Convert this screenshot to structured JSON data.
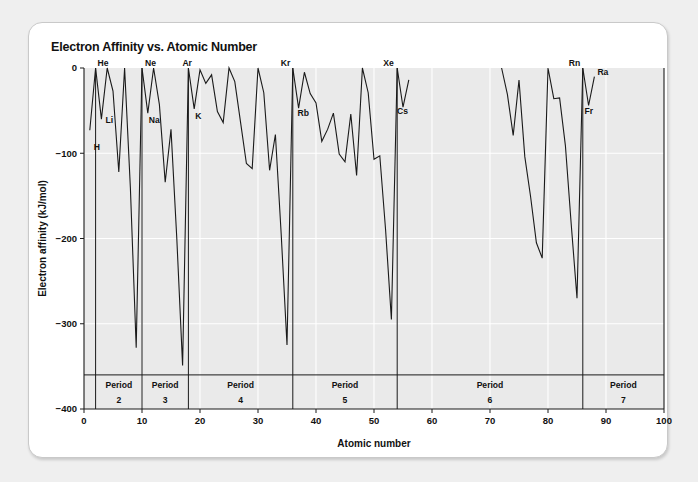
{
  "card": {
    "background": "#ffffff",
    "page_background": "#efefef"
  },
  "chart_data": {
    "type": "line",
    "title": "Electron Affinity vs. Atomic Number",
    "xlabel": "Atomic number",
    "ylabel": "Electron affinity (kJ/mol)",
    "xlim": [
      0,
      100
    ],
    "ylim": [
      -400,
      0
    ],
    "xticks": [
      0,
      10,
      20,
      30,
      40,
      50,
      60,
      70,
      80,
      90,
      100
    ],
    "yticks": [
      0,
      -100,
      -200,
      -300,
      -400
    ],
    "xtick_labels": [
      "0",
      "10",
      "20",
      "30",
      "40",
      "50",
      "60",
      "70",
      "80",
      "90",
      "100"
    ],
    "ytick_labels": [
      "0",
      "-100",
      "-200",
      "-300",
      "-400"
    ],
    "grid": true,
    "grid_color": "#ffffff",
    "plot_background": "#eaeaea",
    "line_color": "#1a1a1a",
    "legend": "none",
    "series": [
      {
        "name": "Electron affinity",
        "x": [
          1,
          2,
          3,
          4,
          5,
          6,
          7,
          8,
          9,
          10,
          11,
          12,
          13,
          14,
          15,
          16,
          17,
          18,
          19,
          20,
          21,
          22,
          23,
          24,
          25,
          26,
          27,
          28,
          29,
          30,
          31,
          32,
          33,
          34,
          35,
          36,
          37,
          38,
          39,
          40,
          41,
          42,
          43,
          44,
          45,
          46,
          47,
          48,
          49,
          50,
          51,
          52,
          53,
          54,
          55,
          56,
          72,
          73,
          74,
          75,
          76,
          77,
          78,
          79,
          80,
          81,
          82,
          83,
          84,
          85,
          86,
          87,
          88
        ],
        "values": [
          -73,
          0,
          -60,
          0,
          -27,
          -122,
          0,
          -141,
          -328,
          0,
          -53,
          0,
          -43,
          -134,
          -72,
          -200,
          -349,
          0,
          -48,
          -2,
          -18,
          -8,
          -51,
          -64,
          0,
          -16,
          -64,
          -112,
          -118,
          0,
          -29,
          -120,
          -78,
          -195,
          -325,
          0,
          -47,
          -5,
          -30,
          -41,
          -86,
          -72,
          -53,
          -101,
          -110,
          -54,
          -126,
          0,
          -29,
          -107,
          -103,
          -190,
          -295,
          0,
          -46,
          -14,
          0,
          -31,
          -79,
          -14,
          -104,
          -151,
          -205,
          -223,
          0,
          -36,
          -35,
          -91,
          -183,
          -270,
          0,
          -44,
          -10
        ]
      }
    ],
    "point_labels": [
      {
        "element": "H",
        "x": 1,
        "y": -73,
        "dx": 4,
        "dy": 20
      },
      {
        "element": "He",
        "x": 2,
        "y": 0,
        "dx": 2,
        "dy": -2
      },
      {
        "element": "Li",
        "x": 3,
        "y": -60,
        "dx": 4,
        "dy": 4
      },
      {
        "element": "Ne",
        "x": 10,
        "y": 0,
        "dx": 3,
        "dy": -2
      },
      {
        "element": "Na",
        "x": 11,
        "y": -53,
        "dx": 1,
        "dy": 10
      },
      {
        "element": "Ar",
        "x": 18,
        "y": 0,
        "dx": -6,
        "dy": -2
      },
      {
        "element": "K",
        "x": 19,
        "y": -48,
        "dx": 1,
        "dy": 10
      },
      {
        "element": "Kr",
        "x": 36,
        "y": 0,
        "dx": -12,
        "dy": -2
      },
      {
        "element": "Rb",
        "x": 37,
        "y": -47,
        "dx": -1,
        "dy": 8
      },
      {
        "element": "Xe",
        "x": 54,
        "y": 0,
        "dx": -14,
        "dy": -2
      },
      {
        "element": "Cs",
        "x": 55,
        "y": -46,
        "dx": -6,
        "dy": 7
      },
      {
        "element": "Rn",
        "x": 86,
        "y": 0,
        "dx": -14,
        "dy": -2
      },
      {
        "element": "Fr",
        "x": 87,
        "y": -44,
        "dx": -4,
        "dy": 8
      },
      {
        "element": "Ra",
        "x": 88,
        "y": -10,
        "dx": 3,
        "dy": -2
      }
    ],
    "period_bands": [
      {
        "label_line1": "Period",
        "label_line2": "2",
        "start": 2,
        "end": 10
      },
      {
        "label_line1": "Period",
        "label_line2": "3",
        "start": 10,
        "end": 18
      },
      {
        "label_line1": "Period",
        "label_line2": "4",
        "start": 18,
        "end": 36
      },
      {
        "label_line1": "Period",
        "label_line2": "5",
        "start": 36,
        "end": 54
      },
      {
        "label_line1": "Period",
        "label_line2": "6",
        "start": 54,
        "end": 86
      },
      {
        "label_line1": "Period",
        "label_line2": "7",
        "start": 86,
        "end": 100
      }
    ],
    "period_divider_x": [
      2,
      10,
      18,
      36,
      54,
      86
    ]
  }
}
